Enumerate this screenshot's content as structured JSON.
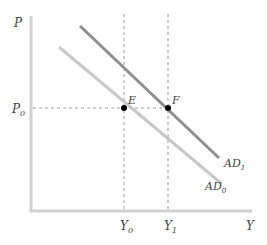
{
  "diagram": {
    "axes": {
      "y_label": "P",
      "x_label": "Y",
      "y_tick": {
        "base": "P",
        "sub": "0"
      },
      "x_ticks": [
        {
          "base": "Y",
          "sub": "0"
        },
        {
          "base": "Y",
          "sub": "1"
        }
      ]
    },
    "curves": [
      {
        "name": "AD",
        "sub": "0",
        "color": "#c8c8c8"
      },
      {
        "name": "AD",
        "sub": "1",
        "color": "#8e8e8e"
      }
    ],
    "points": [
      {
        "label": "E"
      },
      {
        "label": "F"
      }
    ],
    "colors": {
      "axis": "#d0d0d0",
      "dashed": "#9a9a9a",
      "point": "#000000"
    }
  }
}
